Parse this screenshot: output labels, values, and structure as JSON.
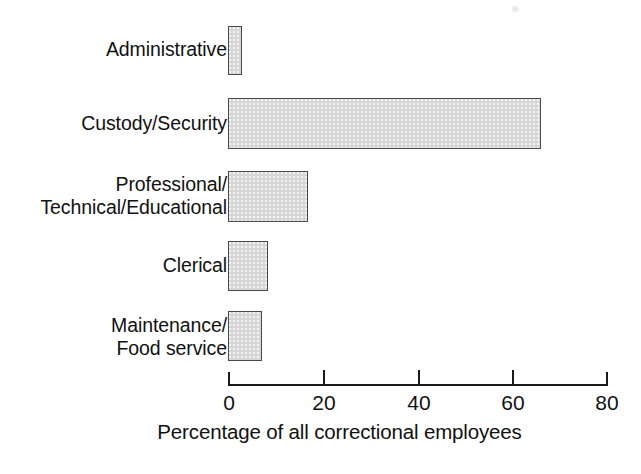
{
  "chart_data": {
    "type": "bar",
    "orientation": "horizontal",
    "title": "",
    "subtitle": "",
    "xlabel": "Percentage of all correctional employees",
    "ylabel": "",
    "categories": [
      "Administrative",
      "Custody/Security",
      "Professional/\nTechnical/Educational",
      "Clerical",
      "Maintenance/\nFood service"
    ],
    "values": [
      3,
      66,
      17,
      8.5,
      7
    ],
    "xlim": [
      0,
      80
    ],
    "ylim": null,
    "xticks": [
      0,
      20,
      40,
      60,
      80
    ],
    "xtick_labels": [
      "0",
      "20",
      "40",
      "60",
      "80"
    ],
    "grid": false,
    "legend": null,
    "bar_fill_color": "#d6d6d6",
    "bar_border_color": "#4a4a4a",
    "background_color": "#ffffff",
    "text_color": "#111111"
  },
  "bars": [
    {
      "label": "Administrative",
      "value": 3,
      "top": 26,
      "height": 49,
      "width_px": 14
    },
    {
      "label": "Custody/Security",
      "value": 66,
      "top": 98,
      "height": 51,
      "width_px": 313
    },
    {
      "label": "Professional/\nTechnical/Educational",
      "value": 17,
      "top": 171,
      "height": 51,
      "width_px": 80
    },
    {
      "label": "Clerical",
      "value": 8.5,
      "top": 241,
      "height": 50,
      "width_px": 40
    },
    {
      "label": "Maintenance/\nFood service",
      "value": 7,
      "top": 311,
      "height": 50,
      "width_px": 34
    }
  ],
  "label_positions": [
    {
      "top": 38
    },
    {
      "top": 112
    },
    {
      "top": 173
    },
    {
      "top": 254
    },
    {
      "top": 314
    }
  ],
  "axis": {
    "ticks": [
      {
        "label": "0",
        "x": 228
      },
      {
        "label": "20",
        "x": 323
      },
      {
        "label": "40",
        "x": 418
      },
      {
        "label": "60",
        "x": 512
      },
      {
        "label": "80",
        "x": 606
      }
    ],
    "title": "Percentage of all correctional employees"
  }
}
